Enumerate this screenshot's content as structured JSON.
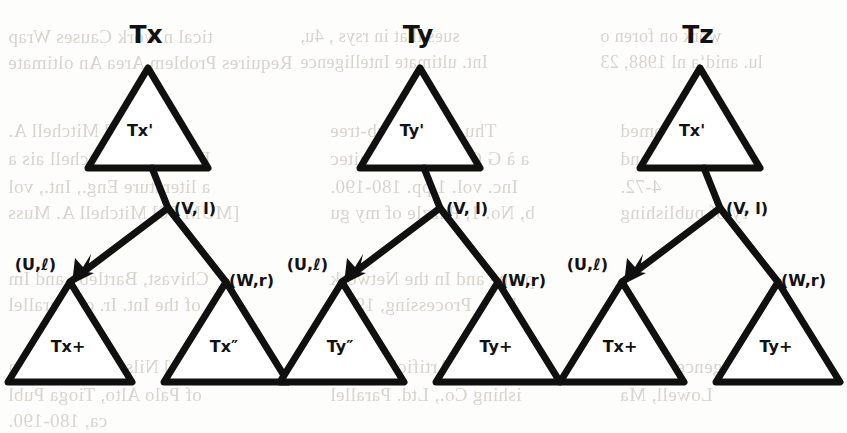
{
  "page": {
    "width": 847,
    "height": 433,
    "background_color": "#fdfdfb",
    "ink_color": "#101010",
    "bleed_color": "#b9b3a8"
  },
  "diagram": {
    "type": "tree-transformation-diagram",
    "tree_count": 3,
    "shared_edge_labels": {
      "root_edge": "(V, l)",
      "left_edge": "(U,ℓ)",
      "right_edge": "(W,r)"
    },
    "trees": [
      {
        "id": "tree-tx",
        "top_label": "Tx",
        "root_triangle_label": "Tx'",
        "root_edge_label": "(V, l)",
        "left_edge_label": "(U,ℓ)",
        "right_edge_label": "(W,r)",
        "left_leaf_label": "Tx+",
        "right_leaf_label": "Tx″"
      },
      {
        "id": "tree-ty",
        "top_label": "Ty",
        "root_triangle_label": "Ty'",
        "root_edge_label": "(V, l)",
        "left_edge_label": "(U,ℓ)",
        "right_edge_label": "(W,r)",
        "left_leaf_label": "Ty″",
        "right_leaf_label": "Ty+"
      },
      {
        "id": "tree-tz",
        "top_label": "Tz",
        "root_triangle_label": "Tx'",
        "root_edge_label": "(V, l)",
        "left_edge_label": "(U,ℓ)",
        "right_edge_label": "(W,r)",
        "left_leaf_label": "Tx+",
        "right_leaf_label": "Ty+"
      }
    ]
  },
  "bleed_text": {
    "description": "faint mirrored show-through text from the reverse of the scanned page",
    "lines": [
      {
        "x": 8,
        "y": 26,
        "text": "tical n work      Causes Wrap",
        "size": 19
      },
      {
        "x": 8,
        "y": 52,
        "text": "Requires Problem Area An oltimate",
        "size": 19
      },
      {
        "x": 300,
        "y": 26,
        "text": "sues that in  rsys , 4u,",
        "size": 18
      },
      {
        "x": 300,
        "y": 52,
        "text": "Int. ultimate Intelligence",
        "size": 18
      },
      {
        "x": 600,
        "y": 26,
        "text": "work on foren o",
        "size": 18
      },
      {
        "x": 600,
        "y": 52,
        "text": "lu. anid‘a  nl 1988, 23",
        "size": 18
      },
      {
        "x": 8,
        "y": 120,
        "text": "[MITOS] Mitchell A.",
        "size": 19
      },
      {
        "x": 8,
        "y": 148,
        "text": "Data, Perc. Mitchell ais a",
        "size": 19
      },
      {
        "x": 8,
        "y": 176,
        "text": "a literature  Eng., Int., vol",
        "size": 19
      },
      {
        "x": 8,
        "y": 202,
        "text": "[MUM 96] Mitchell A. Muss",
        "size": 19
      },
      {
        "x": 330,
        "y": 120,
        "text": "Thu R K.K. Sub-tree",
        "size": 19
      },
      {
        "x": 330,
        "y": 148,
        "text": "a à G Computer Architec",
        "size": 19
      },
      {
        "x": 330,
        "y": 176,
        "text": "Inc. vol. 1 pp. 180-190.",
        "size": 19
      },
      {
        "x": 330,
        "y": 202,
        "text": "b, No. 1, Puzzle of my gu",
        "size": 19
      },
      {
        "x": 620,
        "y": 120,
        "text": "e, R. • romed",
        "size": 19
      },
      {
        "x": 620,
        "y": 148,
        "text": "Transact ion and",
        "size": 19
      },
      {
        "x": 620,
        "y": 176,
        "text": "4-72.",
        "size": 19
      },
      {
        "x": 620,
        "y": 202,
        "text": "ry of publishing",
        "size": 19
      },
      {
        "x": 8,
        "y": 268,
        "text": "Chivast, Bartleby and Im",
        "size": 19
      },
      {
        "x": 8,
        "y": 294,
        "text": "of the Int. Ir. on Parallel",
        "size": 19
      },
      {
        "x": 330,
        "y": 268,
        "text": "prune and In the Network",
        "size": 19
      },
      {
        "x": 330,
        "y": 294,
        "text": "Instr. Processing, 1990.",
        "size": 19
      },
      {
        "x": 8,
        "y": 356,
        "text": "[NIL 80] Nilsson N. J. “Prin",
        "size": 19
      },
      {
        "x": 8,
        "y": 384,
        "text": "of Palo Alto, Tioga Publ",
        "size": 19
      },
      {
        "x": 8,
        "y": 410,
        "text": "ca, 180-190.",
        "size": 19
      },
      {
        "x": 330,
        "y": 356,
        "text": "ciples of Artificial Intell",
        "size": 19
      },
      {
        "x": 330,
        "y": 384,
        "text": "ishing Co., Ltd.  Parallel",
        "size": 19
      },
      {
        "x": 620,
        "y": 356,
        "text": "igence CA 19",
        "size": 19
      },
      {
        "x": 620,
        "y": 384,
        "text": "Lowell, Ma",
        "size": 19
      }
    ]
  }
}
